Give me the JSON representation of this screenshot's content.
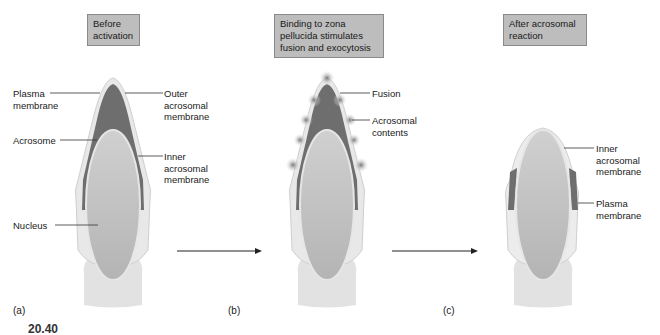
{
  "figure": {
    "caption_number": "20.40",
    "panels": [
      {
        "id": "a",
        "letter": "(a)",
        "stage_box": "Before\nactivation",
        "labels": {
          "plasma_membrane": "Plasma\nmembrane",
          "outer_acrosomal_membrane": "Outer\nacrosomal\nmembrane",
          "acrosome": "Acrosome",
          "inner_acrosomal_membrane": "Inner\nacrosomal\nmembrane",
          "nucleus": "Nucleus"
        }
      },
      {
        "id": "b",
        "letter": "(b)",
        "stage_box": "Binding to zona\npellucida stimulates\nfusion and exocytosis",
        "labels": {
          "fusion": "Fusion",
          "acrosomal_contents": "Acrosomal\ncontents"
        }
      },
      {
        "id": "c",
        "letter": "(c)",
        "stage_box": "After acrosomal\nreaction",
        "labels": {
          "inner_acrosomal_membrane": "Inner\nacrosomal\nmembrane",
          "plasma_membrane": "Plasma\nmembrane"
        }
      }
    ],
    "colors": {
      "stage_box": "#bdbdbd",
      "acrosome": "#6e6e6e",
      "nucleus": "#bcbcbc",
      "membrane": "#e6e6e6",
      "tail": "#e2e2e2"
    }
  }
}
